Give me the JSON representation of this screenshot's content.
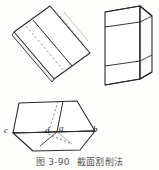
{
  "figure": {
    "caption_number": "图 3-90",
    "caption_title": "截面割削法",
    "background_color": "#fdfdfb",
    "line_color": "#2b2b2b",
    "fill_color": "#ffffff"
  },
  "panels": {
    "net": {
      "name": "unfolded-sheet-net",
      "description": "tilted rectangular sheet with vertical fold lines"
    },
    "prism": {
      "name": "prism-3d",
      "description": "three-dimensional prism with banded horizontal faces"
    },
    "pentagon": {
      "name": "pentagon-solid",
      "description": "pentagonal solid with cut wedge and labelled vertices"
    }
  },
  "vertex_labels": [
    {
      "id": "c",
      "text": "c",
      "x": 4,
      "y": 127
    },
    {
      "id": "d",
      "text": "d",
      "x": 45,
      "y": 127
    },
    {
      "id": "a",
      "text": "a",
      "x": 59,
      "y": 125
    },
    {
      "id": "b",
      "text": "b",
      "x": 92,
      "y": 126
    }
  ]
}
